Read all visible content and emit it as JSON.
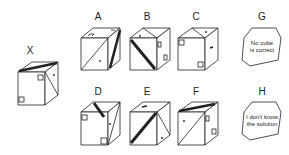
{
  "reference": {
    "label": "X"
  },
  "options": [
    {
      "label": "A"
    },
    {
      "label": "B"
    },
    {
      "label": "C"
    },
    {
      "label": "G",
      "text_line1": "No cube",
      "text_line2": "is correct"
    },
    {
      "label": "D"
    },
    {
      "label": "E"
    },
    {
      "label": "F"
    },
    {
      "label": "H",
      "text_line1": "I don't know",
      "text_line2": "the solution"
    }
  ]
}
